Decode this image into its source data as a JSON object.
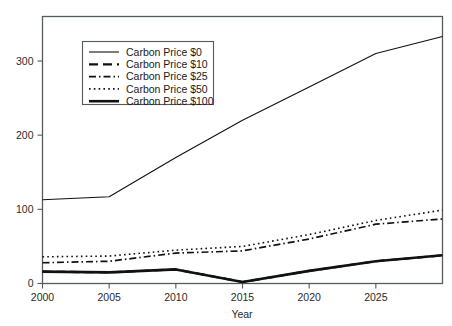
{
  "chart_data": {
    "type": "line",
    "title": "",
    "xlabel": "Year",
    "ylabel": "",
    "xlim": [
      2000,
      2030
    ],
    "ylim": [
      0,
      360
    ],
    "grid": false,
    "legend_position": "upper-left",
    "x": [
      2000,
      2005,
      2010,
      2015,
      2020,
      2025,
      2030
    ],
    "xticks": [
      "2000",
      "2005",
      "2010",
      "2015",
      "2020",
      "2025"
    ],
    "xtick_values": [
      2000,
      2005,
      2010,
      2015,
      2020,
      2025
    ],
    "yticks": [
      "0",
      "100",
      "200",
      "300"
    ],
    "ytick_values": [
      0,
      100,
      200,
      300
    ],
    "series": [
      {
        "name": "Carbon Price $0",
        "style": "solid-thin",
        "values": [
          113,
          117,
          170,
          220,
          265,
          310,
          333
        ]
      },
      {
        "name": "Carbon Price $10",
        "style": "dashed",
        "values": [
          16,
          15,
          19,
          2,
          17,
          30,
          38
        ]
      },
      {
        "name": "Carbon Price $25",
        "style": "dash-dot",
        "values": [
          28,
          30,
          41,
          44,
          60,
          80,
          87
        ]
      },
      {
        "name": "Carbon Price $50",
        "style": "dotted",
        "values": [
          36,
          37,
          45,
          50,
          66,
          85,
          99
        ]
      },
      {
        "name": "Carbon Price $100",
        "style": "solid-thick",
        "values": [
          16,
          15,
          19,
          2,
          17,
          30,
          38
        ]
      }
    ]
  },
  "legend": {
    "entries": [
      {
        "label": "Carbon Price $0"
      },
      {
        "label": "Carbon Price $10"
      },
      {
        "label": "Carbon Price $25"
      },
      {
        "label": "Carbon Price $50"
      },
      {
        "label": "Carbon Price $100"
      }
    ]
  },
  "axes": {
    "x_title": "Year",
    "x_tick_labels": [
      "2000",
      "2005",
      "2010",
      "2015",
      "2020",
      "2025"
    ],
    "y_tick_labels": [
      "0",
      "100",
      "200",
      "300"
    ]
  },
  "colors": {
    "line": "#111111",
    "axis": "#555a5e",
    "background": "#ffffff",
    "text": "#1a1a1a"
  }
}
